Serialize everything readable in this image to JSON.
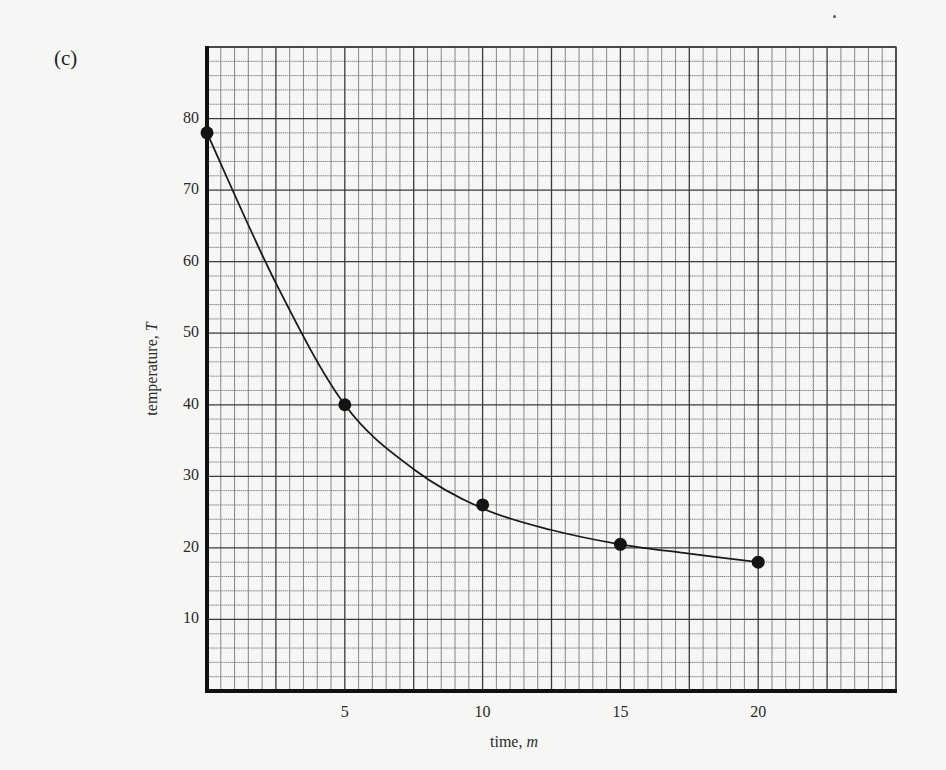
{
  "figure": {
    "part_label": "(c)",
    "xlabel_text": "time, ",
    "xlabel_var": "m",
    "ylabel_text": "temperature, ",
    "ylabel_var": "T",
    "colors": {
      "background": "#f6f6f4",
      "grid_minor": "#7a7a7a",
      "grid_major": "#3a3a3a",
      "axis": "#111111",
      "curve": "#1a1a1a",
      "point": "#141414"
    }
  },
  "chart_data": {
    "type": "scatter",
    "title": "",
    "subtitle": "(c)",
    "xlabel": "time, m",
    "ylabel": "temperature, T",
    "xlim": [
      0,
      25
    ],
    "ylim": [
      0,
      90
    ],
    "x_ticks": [
      5,
      10,
      15,
      20
    ],
    "y_ticks": [
      10,
      20,
      30,
      40,
      50,
      60,
      70,
      80
    ],
    "grid": true,
    "grid_minor_x_step": 0.5,
    "grid_major_x_step": 2.5,
    "grid_minor_y_step": 2,
    "grid_major_y_step": 10,
    "legend": null,
    "series": [
      {
        "name": "measured temperature",
        "style": "points",
        "x": [
          0,
          5,
          10,
          15,
          20
        ],
        "y": [
          78,
          40,
          26,
          20.5,
          18
        ]
      },
      {
        "name": "smooth fitted curve",
        "style": "line",
        "x": [
          0,
          2.5,
          5,
          7.5,
          10,
          12.5,
          15,
          17.5,
          20
        ],
        "y": [
          78,
          57,
          40,
          31,
          25.5,
          22.5,
          20.5,
          19.2,
          18
        ]
      }
    ]
  }
}
